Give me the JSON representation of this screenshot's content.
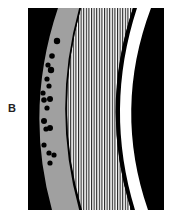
{
  "figure": {
    "panel_label": "B",
    "colors": {
      "background": "#000000",
      "band_gray": "#a0a0a0",
      "stripe_light": "#ffffff",
      "stripe_dark": "#222222",
      "white_band": "#ffffff",
      "dots": "#000000"
    },
    "dots": [
      {
        "cx": 57,
        "cy": 41,
        "r": 3.2
      },
      {
        "cx": 52,
        "cy": 56,
        "r": 2.8
      },
      {
        "cx": 48,
        "cy": 65,
        "r": 2.6
      },
      {
        "cx": 51,
        "cy": 70,
        "r": 3.2
      },
      {
        "cx": 47,
        "cy": 79,
        "r": 2.6
      },
      {
        "cx": 49,
        "cy": 86,
        "r": 2.6
      },
      {
        "cx": 43,
        "cy": 93,
        "r": 2.6
      },
      {
        "cx": 44,
        "cy": 100,
        "r": 2.8
      },
      {
        "cx": 50,
        "cy": 99,
        "r": 3.0
      },
      {
        "cx": 47,
        "cy": 108,
        "r": 2.6
      },
      {
        "cx": 44,
        "cy": 121,
        "r": 3.0
      },
      {
        "cx": 50,
        "cy": 128,
        "r": 3.0
      },
      {
        "cx": 46,
        "cy": 129,
        "r": 2.6
      },
      {
        "cx": 44,
        "cy": 145,
        "r": 2.6
      },
      {
        "cx": 49,
        "cy": 153,
        "r": 2.6
      },
      {
        "cx": 54,
        "cy": 155,
        "r": 2.6
      },
      {
        "cx": 50,
        "cy": 163,
        "r": 2.6
      }
    ]
  }
}
